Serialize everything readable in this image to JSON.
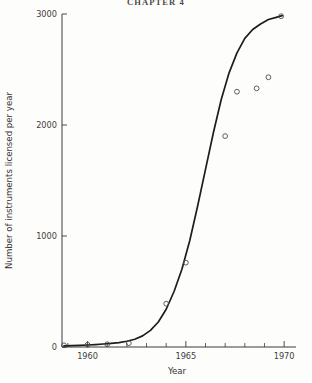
{
  "page": {
    "running_head": "CHAPTER 4"
  },
  "chart_data": {
    "type": "line",
    "title": "",
    "xlabel": "Year",
    "ylabel": "Number of instruments licensed per year",
    "xlim": [
      1958.7,
      1970.4
    ],
    "ylim": [
      0,
      3000
    ],
    "grid": false,
    "legend": null,
    "x_ticks": [
      1960,
      1965,
      1970
    ],
    "x_tick_labels": [
      "1960",
      "1965",
      "1970"
    ],
    "x_minor_ticks": [
      1959,
      1961,
      1962,
      1963,
      1964,
      1966,
      1967,
      1968,
      1969
    ],
    "y_ticks": [
      0,
      1000,
      2000,
      3000
    ],
    "y_tick_labels": [
      "0",
      "1000",
      "2000",
      "3000"
    ],
    "series": [
      {
        "name": "fitted logistic curve",
        "style": "solid-line",
        "x": [
          1958.8,
          1959.2,
          1959.6,
          1960.0,
          1960.4,
          1960.8,
          1961.2,
          1961.6,
          1962.0,
          1962.4,
          1962.8,
          1963.2,
          1963.6,
          1964.0,
          1964.4,
          1964.8,
          1965.2,
          1965.6,
          1966.0,
          1966.4,
          1966.8,
          1967.2,
          1967.6,
          1968.0,
          1968.4,
          1968.8,
          1969.2,
          1969.6,
          1969.9
        ],
        "y": [
          10,
          12,
          15,
          18,
          22,
          27,
          33,
          40,
          52,
          70,
          100,
          150,
          225,
          340,
          500,
          700,
          960,
          1270,
          1600,
          1930,
          2230,
          2470,
          2650,
          2780,
          2860,
          2910,
          2950,
          2970,
          2985
        ]
      },
      {
        "name": "observed data points",
        "style": "open-circle-markers",
        "x": [
          1958.8,
          1960.0,
          1961.0,
          1962.1,
          1964.0,
          1965.0,
          1967.0,
          1967.6,
          1968.6,
          1969.2,
          1969.85
        ],
        "y": [
          15,
          20,
          25,
          35,
          390,
          760,
          1900,
          2300,
          2330,
          2430,
          2980
        ]
      }
    ]
  }
}
